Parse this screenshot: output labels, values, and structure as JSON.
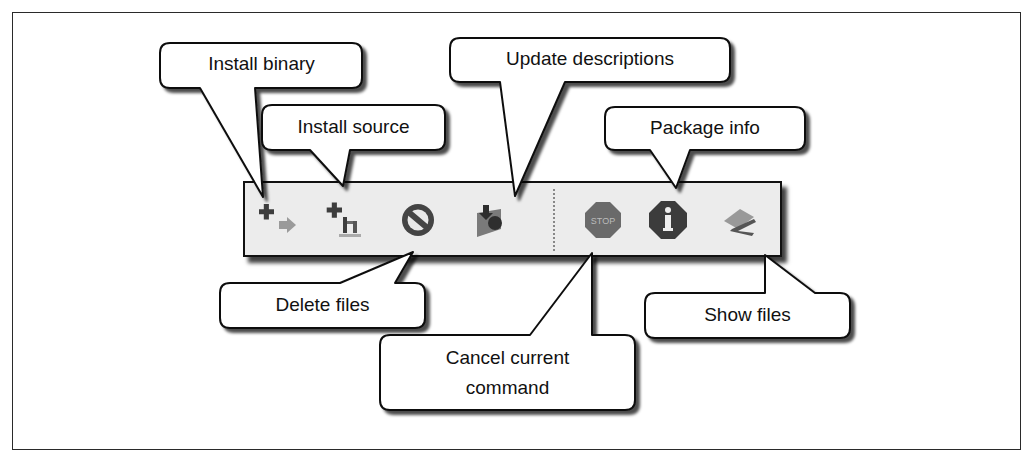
{
  "figure": {
    "toolbar": {
      "buttons": [
        {
          "id": "install-binary",
          "icon": "install-binary-icon"
        },
        {
          "id": "install-source",
          "icon": "install-source-icon"
        },
        {
          "id": "delete-files",
          "icon": "delete-no-entry-icon"
        },
        {
          "id": "update-descriptions",
          "icon": "update-download-icon"
        },
        {
          "id": "cancel-current-command",
          "icon": "stop-sign-icon",
          "icon_text": "STOP"
        },
        {
          "id": "package-info",
          "icon": "info-icon",
          "icon_text": "i"
        },
        {
          "id": "show-files",
          "icon": "show-files-icon"
        }
      ]
    },
    "callouts": {
      "install_binary": "Install binary",
      "install_source": "Install source",
      "update_descriptions": "Update descriptions",
      "package_info": "Package info",
      "delete_files": "Delete files",
      "cancel_current_command_line1": "Cancel current",
      "cancel_current_command_line2": "command",
      "show_files": "Show files"
    },
    "colors": {
      "toolbar_bg": "#ececec",
      "icon_dark": "#3a3a3a",
      "icon_mid": "#7a7a7a",
      "border": "#111111"
    }
  }
}
